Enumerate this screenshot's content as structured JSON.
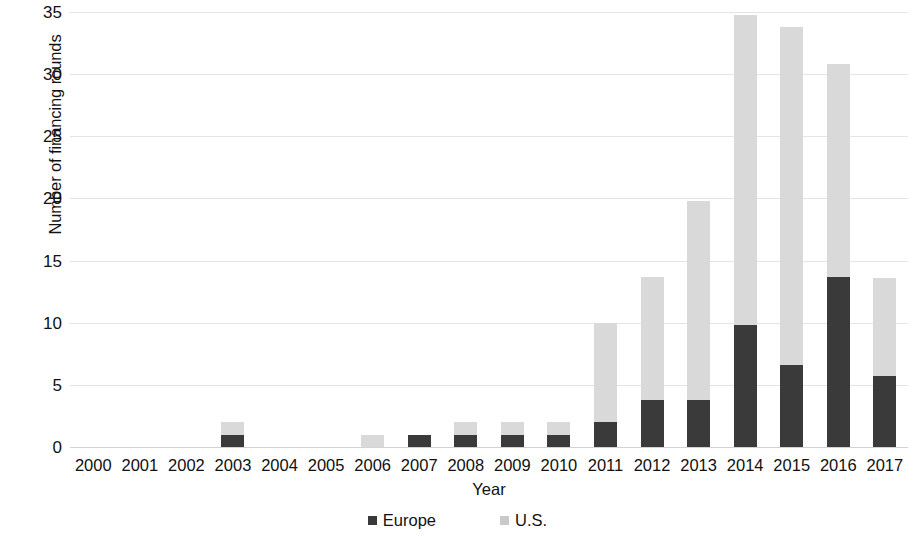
{
  "chart_data": {
    "type": "bar",
    "subtype": "stacked-column",
    "title": "",
    "xlabel": "Year",
    "ylabel": "Number of financing rounds",
    "ylim": [
      0,
      35
    ],
    "yticks": [
      0,
      5,
      10,
      15,
      20,
      25,
      30,
      35
    ],
    "grid": true,
    "legend_position": "bottom",
    "categories": [
      "2000",
      "2001",
      "2002",
      "2003",
      "2004",
      "2005",
      "2006",
      "2007",
      "2008",
      "2009",
      "2010",
      "2011",
      "2012",
      "2013",
      "2014",
      "2015",
      "2016",
      "2017"
    ],
    "series": [
      {
        "name": "Europe",
        "color": "#3a3a3a",
        "values": [
          0,
          0,
          0,
          1,
          0,
          0,
          0,
          1,
          1,
          1,
          1,
          2,
          3.8,
          3.8,
          9.8,
          6.6,
          13.7,
          5.7
        ]
      },
      {
        "name": "U.S.",
        "color": "#d9d9d9",
        "values": [
          0,
          0,
          0,
          1,
          0,
          0,
          1,
          0,
          1,
          1,
          1,
          8,
          9.9,
          16,
          25,
          27.2,
          17.1,
          7.9
        ]
      }
    ],
    "totals": [
      0,
      0,
      0,
      2,
      0,
      0,
      1,
      1,
      2,
      2,
      2,
      10,
      13.7,
      19.8,
      34.8,
      33.8,
      30.8,
      13.6
    ]
  },
  "legend": {
    "items": [
      {
        "label": "Europe",
        "swatch": "europe-swatch"
      },
      {
        "label": "U.S.",
        "swatch": "us-swatch"
      }
    ]
  }
}
